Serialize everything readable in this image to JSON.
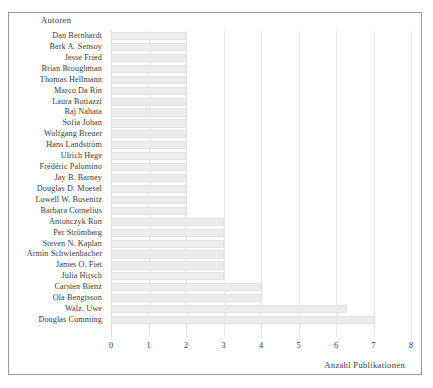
{
  "chart_data": {
    "type": "bar",
    "orientation": "horizontal",
    "title": "",
    "xlabel": "Anzahl Publikationen",
    "ylabel": "Autoren",
    "xlim": [
      0,
      8
    ],
    "xticks": [
      0,
      1,
      2,
      3,
      4,
      5,
      6,
      7,
      8
    ],
    "xtick_labels": [
      "0",
      "1",
      "2",
      "3",
      "4",
      "5",
      "6",
      "7",
      "8"
    ],
    "grid": true,
    "legend": null,
    "bar_color": "#ececec",
    "categories": [
      "Dan Bernhardt",
      "Berk A. Sensoy",
      "Jesse Fried",
      "Brian Broughman",
      "Thomas Hellmann",
      "Marco Da Rin",
      "Laura Bottazzi",
      "Raj Nahata",
      "Sofia Johan",
      "Wolfgang Breuer",
      "Hans Landström",
      "Ulrich Hege",
      "Frédéric Palomino",
      "Jay B. Barney",
      "Douglas D. Moesel",
      "Lowell W. Busenitz",
      "Barbara Cornelius",
      "Antonczyk Ron",
      "Per Strömberg",
      "Steven N. Kaplan",
      "Armin Schwienbacher",
      "James O. Fiet",
      "Julia Hirsch",
      "Carsten Bienz",
      "Ola Bengtsson",
      "Walz, Uwe",
      "Douglas Cumming"
    ],
    "values": [
      2,
      2,
      2,
      2,
      2,
      2,
      2,
      2,
      2,
      2,
      2,
      2,
      2,
      2,
      2,
      2,
      2,
      3,
      3,
      3,
      3,
      3,
      3,
      4,
      4,
      6.3,
      7
    ]
  }
}
